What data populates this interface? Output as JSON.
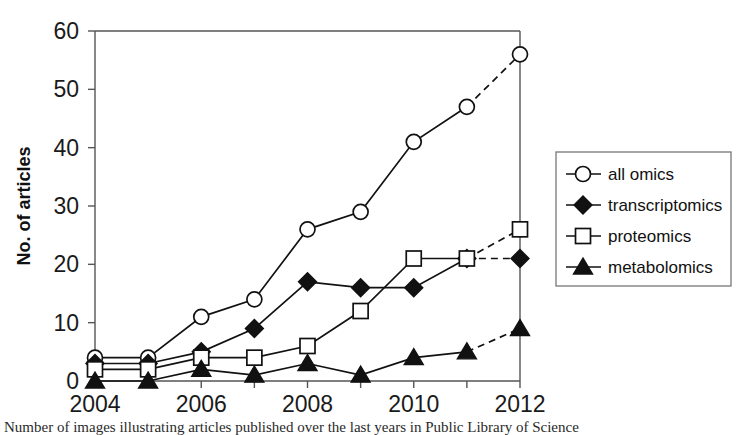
{
  "chart_data": {
    "type": "line",
    "title": "",
    "xlabel": "",
    "ylabel": "No. of articles",
    "x": [
      2004,
      2005,
      2006,
      2007,
      2008,
      2009,
      2010,
      2011,
      2012
    ],
    "xtick_labels": [
      "2004",
      "2006",
      "2008",
      "2010",
      "2012"
    ],
    "xtick_values": [
      2004,
      2006,
      2008,
      2010,
      2012
    ],
    "xlim": [
      2004,
      2012
    ],
    "ytick_labels": [
      "0",
      "10",
      "20",
      "30",
      "40",
      "50",
      "60"
    ],
    "ytick_values": [
      0,
      10,
      20,
      30,
      40,
      50,
      60
    ],
    "ylim": [
      0,
      60
    ],
    "grid": false,
    "legend_position": "right",
    "series": [
      {
        "name": "all omics",
        "marker": "open-circle",
        "values": [
          4,
          4,
          11,
          14,
          26,
          29,
          41,
          47,
          56
        ],
        "dashed_from_index": 7
      },
      {
        "name": "transcriptomics",
        "marker": "filled-diamond",
        "values": [
          3,
          3,
          5,
          9,
          17,
          16,
          16,
          21,
          21
        ],
        "dashed_from_index": 7
      },
      {
        "name": "proteomics",
        "marker": "open-square",
        "values": [
          2,
          2,
          4,
          4,
          6,
          12,
          21,
          21,
          26
        ],
        "dashed_from_index": 7
      },
      {
        "name": "metabolomics",
        "marker": "filled-triangle",
        "values": [
          0,
          0,
          2,
          1,
          3,
          1,
          4,
          5,
          9
        ],
        "dashed_from_index": 7
      }
    ]
  },
  "caption": {
    "text": "Number of images illustrating articles published over the last years in Public Library of Science"
  },
  "colors": {
    "line": "#111111",
    "axis": "#555555",
    "background": "#ffffff"
  }
}
